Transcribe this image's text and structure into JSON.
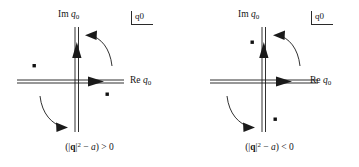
{
  "figure": {
    "stroke_color": "#1a1a1a",
    "background": "#ffffff"
  },
  "panels": [
    {
      "id": "left",
      "imaginary_axis_label": "Im",
      "real_axis_label": "Re",
      "variable": "q",
      "variable_subscript": "0",
      "corner_tag_variable": "q",
      "corner_tag_subscript": "0",
      "caption": "(|q|² − a) > 0",
      "caption_parts": {
        "open": "(|",
        "vector": "q",
        "close_abs": "|",
        "power": "2",
        "minus": " − ",
        "param": "a",
        "close": ")",
        "relation": "> 0"
      },
      "poles": [
        {
          "name": "pole-upper-left",
          "x": -43,
          "y": 16,
          "label": ""
        },
        {
          "name": "pole-lower-right",
          "x": 30,
          "y": -12,
          "label": ""
        }
      ],
      "contour": {
        "horizontal_arrow_direction": "right",
        "vertical_arrow_direction": "up",
        "rotation_arrow_upper": "counterclockwise",
        "rotation_arrow_lower": "counterclockwise"
      }
    },
    {
      "id": "right",
      "imaginary_axis_label": "Im",
      "real_axis_label": "Re",
      "variable": "q",
      "variable_subscript": "0",
      "corner_tag_variable": "q",
      "corner_tag_subscript": "0",
      "caption": "(|q|² − a) < 0",
      "caption_parts": {
        "open": "(|",
        "vector": "q",
        "close_abs": "|",
        "power": "2",
        "minus": " − ",
        "param": "a",
        "close": ")",
        "relation": "< 0"
      },
      "poles": [
        {
          "name": "pole-upper-left",
          "x": -13,
          "y": 40,
          "label": ""
        },
        {
          "name": "pole-lower-right",
          "x": 10,
          "y": -37,
          "label": ""
        }
      ],
      "contour": {
        "horizontal_arrow_direction": "right",
        "vertical_arrow_direction": "up",
        "rotation_arrow_upper": "counterclockwise",
        "rotation_arrow_lower": "counterclockwise"
      }
    }
  ]
}
